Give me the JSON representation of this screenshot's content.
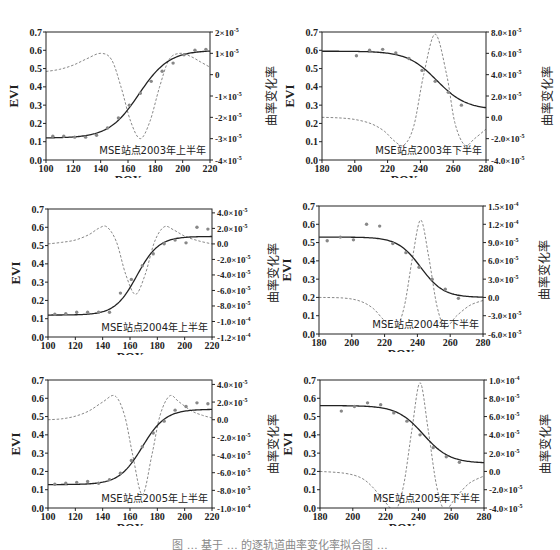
{
  "figure": {
    "caption": "图 … 基于 … 的逐轨道曲率变化率拟合图 …"
  },
  "common": {
    "xlabel": "DOY",
    "ylabel_left": "EVI",
    "ylabel_right": "曲率变化率",
    "left_ticks": [
      "0.0",
      "0.1",
      "0.2",
      "0.3",
      "0.4",
      "0.5",
      "0.6",
      "0.7"
    ],
    "left_range": [
      0,
      0.7
    ],
    "colors": {
      "fit": "#222222",
      "points": "#888888",
      "curvature": "#888888",
      "axis": "#222222"
    }
  },
  "chart_data": [
    {
      "type": "line",
      "title": "MSE站点2003年上半年",
      "xlabel": "DOY",
      "ylabel": "EVI",
      "ylabel_right": "曲率变化率",
      "xlim": [
        100,
        220
      ],
      "ylim": [
        0,
        0.7
      ],
      "ylim_right": [
        -4e-05,
        2e-05
      ],
      "x_ticks": [
        100,
        120,
        140,
        160,
        180,
        200,
        220
      ],
      "right_ticks": [
        {
          "v": 2e-05,
          "mant": "2",
          "exp": "-5"
        },
        {
          "v": 1e-05,
          "mant": "1",
          "exp": "-5"
        },
        {
          "v": 0,
          "mant": "0",
          "exp": ""
        },
        {
          "v": -1e-05,
          "mant": "-1",
          "exp": "-5"
        },
        {
          "v": -2e-05,
          "mant": "-2",
          "exp": "-5"
        },
        {
          "v": -3e-05,
          "mant": "-3",
          "exp": "-5"
        },
        {
          "v": -4e-05,
          "mant": "-4",
          "exp": "-5"
        }
      ],
      "observed_evi": {
        "x": [
          105,
          113,
          121,
          129,
          137,
          145,
          153,
          161,
          169,
          177,
          185,
          193,
          201,
          209,
          217
        ],
        "y": [
          0.13,
          0.13,
          0.125,
          0.125,
          0.135,
          0.175,
          0.23,
          0.3,
          0.365,
          0.43,
          0.485,
          0.53,
          0.575,
          0.6,
          0.605
        ]
      },
      "fitted_logistic": {
        "min": 0.12,
        "max": 0.6,
        "mid": 168,
        "scale": 11
      },
      "curvature_rate": {
        "x": [
          100,
          110,
          120,
          130,
          140,
          148,
          155,
          162,
          169,
          176,
          183,
          190,
          198,
          206,
          213,
          220
        ],
        "y": [
          1.5e-06,
          2.5e-06,
          4.5e-06,
          7.5e-06,
          1e-05,
          7e-06,
          -6e-06,
          -2.2e-05,
          -3e-05,
          -2.2e-05,
          -6e-06,
          7e-06,
          1e-05,
          8.5e-06,
          6e-06,
          3.5e-06
        ]
      }
    },
    {
      "type": "line",
      "title": "MSE站点2003年下半年",
      "xlabel": "DOY",
      "ylabel": "EVI",
      "ylabel_right": "曲率变化率",
      "xlim": [
        180,
        280
      ],
      "ylim": [
        0,
        0.7
      ],
      "ylim_right": [
        -4e-05,
        8e-05
      ],
      "x_ticks": [
        180,
        200,
        220,
        240,
        260,
        280
      ],
      "right_ticks": [
        {
          "v": 8e-05,
          "mant": "8.0",
          "exp": "-5"
        },
        {
          "v": 6e-05,
          "mant": "6.0",
          "exp": "-5"
        },
        {
          "v": 4e-05,
          "mant": "4.0",
          "exp": "-5"
        },
        {
          "v": 2e-05,
          "mant": "2.0",
          "exp": "-5"
        },
        {
          "v": 0,
          "mant": "0.0",
          "exp": ""
        },
        {
          "v": -2e-05,
          "mant": "-2.0",
          "exp": "-5"
        },
        {
          "v": -4e-05,
          "mant": "-4.0",
          "exp": "-5"
        }
      ],
      "observed_evi": {
        "x": [
          201,
          209,
          217,
          225,
          233,
          241,
          249,
          257,
          265
        ],
        "y": [
          0.57,
          0.6,
          0.605,
          0.585,
          0.555,
          0.49,
          0.43,
          0.37,
          0.3
        ]
      },
      "fitted_logistic": {
        "min": 0.275,
        "max": 0.595,
        "mid": 250,
        "scale": -9
      },
      "curvature_rate": {
        "x": [
          180,
          190,
          200,
          210,
          218,
          224,
          230,
          236,
          242,
          249,
          256,
          261,
          267,
          273,
          280
        ],
        "y": [
          0,
          -5e-07,
          -2e-06,
          -6e-06,
          -1.3e-05,
          -2.2e-05,
          -2.6e-05,
          -8e-06,
          4e-05,
          7.8e-05,
          4e-05,
          -5e-06,
          -2.6e-05,
          -2e-05,
          -1.1e-05
        ]
      }
    },
    {
      "type": "line",
      "title": "MSE站点2004年上半年",
      "xlabel": "DOY",
      "ylabel": "EVI",
      "ylabel_right": "曲率变化率",
      "xlim": [
        100,
        220
      ],
      "ylim": [
        0,
        0.7
      ],
      "ylim_right": [
        -0.00012,
        4.5e-05
      ],
      "x_ticks": [
        100,
        120,
        140,
        160,
        180,
        200,
        220
      ],
      "right_ticks": [
        {
          "v": 4e-05,
          "mant": "4.0",
          "exp": "-5"
        },
        {
          "v": 2e-05,
          "mant": "2.0",
          "exp": "-5"
        },
        {
          "v": 0,
          "mant": "0.0",
          "exp": ""
        },
        {
          "v": -2e-05,
          "mant": "-2.0",
          "exp": "-5"
        },
        {
          "v": -4e-05,
          "mant": "-4.0",
          "exp": "-5"
        },
        {
          "v": -6e-05,
          "mant": "-6.0",
          "exp": "-5"
        },
        {
          "v": -8e-05,
          "mant": "-8.0",
          "exp": "-5"
        },
        {
          "v": -0.0001,
          "mant": "-1.0",
          "exp": "-4"
        },
        {
          "v": -0.00012,
          "mant": "-1.2",
          "exp": "-4"
        }
      ],
      "observed_evi": {
        "x": [
          105,
          113,
          121,
          129,
          137,
          145,
          153,
          161,
          169,
          177,
          185,
          193,
          201,
          209,
          217
        ],
        "y": [
          0.125,
          0.128,
          0.135,
          0.135,
          0.135,
          0.135,
          0.24,
          0.315,
          0.39,
          0.455,
          0.51,
          0.53,
          0.515,
          0.6,
          0.59
        ]
      },
      "fitted_logistic": {
        "min": 0.12,
        "max": 0.55,
        "mid": 165,
        "scale": 8
      },
      "curvature_rate": {
        "x": [
          100,
          110,
          120,
          130,
          137,
          143,
          150,
          157,
          164,
          171,
          178,
          185,
          192,
          200,
          210,
          220
        ],
        "y": [
          0,
          2e-06,
          5e-06,
          1.2e-05,
          2e-05,
          2.2e-05,
          3e-06,
          -4e-05,
          -6.5e-05,
          -4e-05,
          3e-06,
          2.2e-05,
          1.8e-05,
          1e-05,
          4e-06,
          0
        ]
      }
    },
    {
      "type": "line",
      "title": "MSE站点2004年下半年",
      "xlabel": "DOY",
      "ylabel": "EVI",
      "ylabel_right": "曲率变化率",
      "xlim": [
        180,
        280
      ],
      "ylim": [
        0,
        0.7
      ],
      "ylim_right": [
        -6e-05,
        0.00015
      ],
      "x_ticks": [
        180,
        200,
        220,
        240,
        260,
        280
      ],
      "right_ticks": [
        {
          "v": 0.00015,
          "mant": "1.5",
          "exp": "-4"
        },
        {
          "v": 0.00012,
          "mant": "1.2",
          "exp": "-4"
        },
        {
          "v": 9e-05,
          "mant": "9.0",
          "exp": "-5"
        },
        {
          "v": 6e-05,
          "mant": "6.0",
          "exp": "-5"
        },
        {
          "v": 3e-05,
          "mant": "3.0",
          "exp": "-5"
        },
        {
          "v": 0,
          "mant": "0.0",
          "exp": ""
        },
        {
          "v": -3e-05,
          "mant": "-3.0",
          "exp": "-5"
        },
        {
          "v": -6e-05,
          "mant": "-6.0",
          "exp": "-5"
        }
      ],
      "observed_evi": {
        "x": [
          185,
          193,
          201,
          209,
          217,
          225,
          233,
          241,
          249,
          257,
          265
        ],
        "y": [
          0.51,
          0.53,
          0.515,
          0.6,
          0.59,
          0.495,
          0.445,
          0.365,
          0.3,
          0.245,
          0.195
        ]
      },
      "fitted_logistic": {
        "min": 0.2,
        "max": 0.53,
        "mid": 242,
        "scale": -7
      },
      "curvature_rate": {
        "x": [
          180,
          195,
          205,
          213,
          220,
          227,
          232,
          237,
          242,
          247,
          252,
          257,
          264,
          272,
          280
        ],
        "y": [
          0,
          -1e-06,
          -6e-06,
          -1.8e-05,
          -3.8e-05,
          -4.8e-05,
          -1.5e-05,
          6.5e-05,
          0.000127,
          6.5e-05,
          -1.5e-05,
          -4.8e-05,
          -3e-05,
          -1.3e-05,
          -5e-06
        ]
      }
    },
    {
      "type": "line",
      "title": "MSE站点2005年上半年",
      "xlabel": "DOY",
      "ylabel": "EVI",
      "ylabel_right": "曲率变化率",
      "xlim": [
        100,
        220
      ],
      "ylim": [
        0,
        0.7
      ],
      "ylim_right": [
        -0.0001,
        4.5e-05
      ],
      "x_ticks": [
        100,
        120,
        140,
        160,
        180,
        200,
        220
      ],
      "right_ticks": [
        {
          "v": 4e-05,
          "mant": "4.0",
          "exp": "-5"
        },
        {
          "v": 2e-05,
          "mant": "2.0",
          "exp": "-5"
        },
        {
          "v": 0,
          "mant": "0.0",
          "exp": ""
        },
        {
          "v": -2e-05,
          "mant": "-2.0",
          "exp": "-5"
        },
        {
          "v": -4e-05,
          "mant": "-4.0",
          "exp": "-5"
        },
        {
          "v": -6e-05,
          "mant": "-6.0",
          "exp": "-5"
        },
        {
          "v": -8e-05,
          "mant": "-8.0",
          "exp": "-5"
        },
        {
          "v": -0.0001,
          "mant": "-1.0",
          "exp": "-4"
        }
      ],
      "observed_evi": {
        "x": [
          105,
          113,
          121,
          129,
          137,
          145,
          153,
          161,
          169,
          177,
          185,
          193,
          201,
          209,
          217
        ],
        "y": [
          0.13,
          0.135,
          0.14,
          0.145,
          0.135,
          0.155,
          0.19,
          0.26,
          0.335,
          0.41,
          0.475,
          0.535,
          0.555,
          0.575,
          0.57
        ]
      },
      "fitted_logistic": {
        "min": 0.128,
        "max": 0.54,
        "mid": 169,
        "scale": 8.5
      },
      "curvature_rate": {
        "x": [
          100,
          110,
          120,
          130,
          140,
          149,
          156,
          162,
          169,
          176,
          182,
          189,
          196,
          205,
          213,
          220
        ],
        "y": [
          0,
          1e-06,
          4e-06,
          1e-05,
          2e-05,
          2.7e-05,
          5e-06,
          -4e-05,
          -8.5e-05,
          -4e-05,
          5e-06,
          2.7e-05,
          2e-05,
          1e-05,
          5e-06,
          2e-06
        ]
      }
    },
    {
      "type": "line",
      "title": "MSE站点2005年下半年",
      "xlabel": "DOY",
      "ylabel": "EVI",
      "ylabel_right": "曲率变化率",
      "xlim": [
        180,
        280
      ],
      "ylim": [
        0,
        0.7
      ],
      "ylim_right": [
        -4e-05,
        0.0001
      ],
      "x_ticks": [
        180,
        200,
        220,
        240,
        260,
        280
      ],
      "right_ticks": [
        {
          "v": 0.0001,
          "mant": "1.0",
          "exp": "-4"
        },
        {
          "v": 8e-05,
          "mant": "8.0",
          "exp": "-5"
        },
        {
          "v": 6e-05,
          "mant": "6.0",
          "exp": "-5"
        },
        {
          "v": 4e-05,
          "mant": "4.0",
          "exp": "-5"
        },
        {
          "v": 2e-05,
          "mant": "2.0",
          "exp": "-5"
        },
        {
          "v": 0,
          "mant": "0.0",
          "exp": ""
        },
        {
          "v": -2e-05,
          "mant": "-2.0",
          "exp": "-5"
        },
        {
          "v": -4e-05,
          "mant": "-4.0",
          "exp": "-5"
        }
      ],
      "observed_evi": {
        "x": [
          193,
          201,
          209,
          217,
          225,
          233,
          241,
          249,
          257,
          265
        ],
        "y": [
          0.53,
          0.555,
          0.575,
          0.565,
          0.52,
          0.475,
          0.4,
          0.33,
          0.28,
          0.25
        ]
      },
      "fitted_logistic": {
        "min": 0.245,
        "max": 0.56,
        "mid": 243,
        "scale": -8
      },
      "curvature_rate": {
        "x": [
          180,
          195,
          205,
          212,
          219,
          226,
          231,
          236,
          241,
          246,
          251,
          256,
          263,
          271,
          280
        ],
        "y": [
          0,
          -2e-06,
          -7e-06,
          -1.7e-05,
          -3.2e-05,
          -4.2e-05,
          -1.5e-05,
          4.5e-05,
          9.7e-05,
          4.5e-05,
          -1.5e-05,
          -4.2e-05,
          -2.8e-05,
          -1.3e-05,
          -5e-06
        ]
      }
    }
  ]
}
